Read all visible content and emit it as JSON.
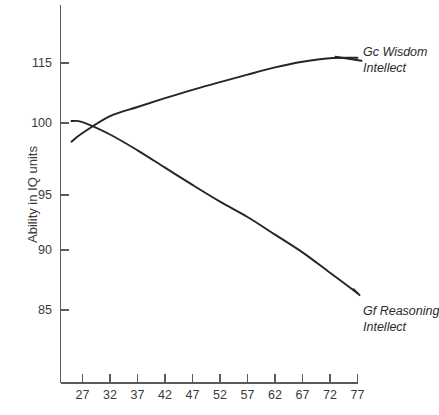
{
  "chart_data": {
    "type": "line",
    "title": "",
    "subtitle": "",
    "xlabel": "",
    "ylabel": "Ability in IQ units",
    "x_ticks": [
      27,
      32,
      37,
      42,
      47,
      52,
      57,
      62,
      67,
      72,
      77
    ],
    "x_tick_labels": [
      "27",
      "32",
      "37",
      "42",
      "47",
      "52",
      "57",
      "62",
      "67",
      "72",
      "77"
    ],
    "y_ticks": [
      85,
      90,
      95,
      100,
      115
    ],
    "y_tick_labels": [
      "85",
      "90",
      "95",
      "100",
      "115"
    ],
    "xlim": [
      25,
      78
    ],
    "ylim": [
      83,
      118
    ],
    "grid": false,
    "legend_position": "right-inline",
    "series": [
      {
        "name": "Gc Wisdom Intellect",
        "label_line1": "Gc Wisdom",
        "label_line2": "Intellect",
        "color": "#25242a",
        "x": [
          25,
          27,
          32,
          37,
          42,
          47,
          52,
          57,
          62,
          67,
          72,
          77
        ],
        "values": [
          98.7,
          99.3,
          101.7,
          104.0,
          106.2,
          108.3,
          110.2,
          112.1,
          113.9,
          115.3,
          116.2,
          116.3
        ]
      },
      {
        "name": "Gf Reasoning Intellect",
        "label_line1": "Gf Reasoning",
        "label_line2": "Intellect",
        "color": "#25242a",
        "x": [
          25,
          27,
          32,
          37,
          42,
          47,
          52,
          57,
          62,
          67,
          72,
          77
        ],
        "values": [
          100.5,
          100.2,
          99.2,
          98.1,
          96.9,
          95.7,
          94.4,
          93.0,
          91.4,
          89.8,
          88.1,
          86.4
        ]
      }
    ]
  }
}
